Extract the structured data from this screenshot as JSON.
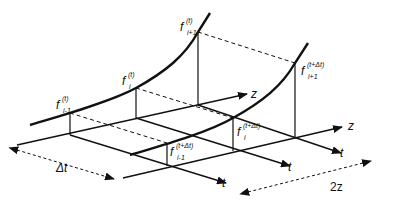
{
  "diagram": {
    "title": "",
    "curves": [
      {
        "name": "profile-at-t",
        "points": {
          "i-1": [
            70,
            113
          ],
          "i": [
            136,
            88
          ],
          "i+1": [
            198,
            32
          ]
        }
      },
      {
        "name": "profile-at-t-plus-dt",
        "points": {
          "i-1": [
            167,
            143
          ],
          "i": [
            233,
            118
          ],
          "i+1": [
            295,
            63
          ]
        }
      }
    ],
    "labels": {
      "f_im1_t": {
        "base": "f",
        "sup": "(t)",
        "sub": "i-1"
      },
      "f_i_t": {
        "base": "f",
        "sup": "(t)",
        "sub": "i"
      },
      "f_ip1_t": {
        "base": "f",
        "sup": "(t)",
        "sub": "i+1"
      },
      "f_im1_tdt": {
        "base": "f",
        "sup": "(t+Δt)",
        "sub": "i-1"
      },
      "f_i_tdt": {
        "base": "f",
        "sup": "(t+Δt)",
        "sub": "i"
      },
      "f_ip1_tdt": {
        "base": "f",
        "sup": "(t+Δt)",
        "sub": "i+1"
      }
    },
    "axes": {
      "z_back": "z",
      "z_front": "z",
      "t1": "t",
      "t2": "t",
      "t3": "t"
    },
    "dimensions": {
      "dt": "Δt",
      "two_z": "2z"
    }
  }
}
